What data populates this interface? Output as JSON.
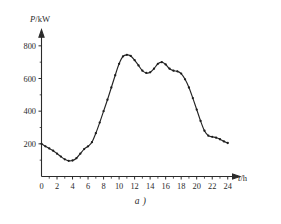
{
  "figure": {
    "caption": "a )"
  },
  "chart_data": {
    "type": "line",
    "title": "",
    "subtitle": "",
    "xlabel": "t/h",
    "ylabel": "P/kW",
    "xlabel_symbol": "t",
    "xlabel_unit": "/h",
    "ylabel_symbol": "P",
    "ylabel_unit": "/kW",
    "xlim": [
      0,
      25.2
    ],
    "ylim": [
      0,
      880
    ],
    "xticks_major": [
      0,
      2,
      4,
      6,
      8,
      10,
      12,
      14,
      16,
      18,
      20,
      22,
      24
    ],
    "xticks_major_labels": [
      "0",
      "2",
      "4",
      "6",
      "8",
      "10",
      "12",
      "14",
      "16",
      "18",
      "20",
      "22",
      "24"
    ],
    "xticks_minor": [
      1,
      3,
      5,
      7,
      9,
      11,
      13,
      15,
      17,
      19,
      21,
      23
    ],
    "yticks_major": [
      200,
      400,
      600,
      800
    ],
    "yticks_major_labels": [
      "200",
      "400",
      "600",
      "800"
    ],
    "yticks_minor": [
      100,
      300,
      500,
      700
    ],
    "grid": false,
    "legend": null,
    "marker": "dot",
    "line_color": "#242424",
    "marker_color": "#1d1d1d",
    "axis_color": "#2b2b2b",
    "x": [
      0.0,
      0.5,
      1.0,
      1.5,
      2.0,
      2.5,
      3.0,
      3.5,
      4.0,
      4.5,
      5.0,
      5.5,
      6.0,
      6.5,
      7.0,
      7.5,
      8.0,
      8.5,
      9.0,
      9.5,
      10.0,
      10.5,
      11.0,
      11.5,
      12.0,
      12.5,
      13.0,
      13.5,
      14.0,
      14.5,
      15.0,
      15.5,
      16.0,
      16.5,
      17.0,
      17.5,
      18.0,
      18.5,
      19.0,
      19.5,
      20.0,
      20.5,
      21.0,
      21.5,
      22.0,
      22.5,
      23.0,
      23.5,
      24.0
    ],
    "y": [
      200,
      185,
      172,
      158,
      140,
      122,
      105,
      96,
      98,
      112,
      140,
      168,
      185,
      210,
      265,
      330,
      400,
      470,
      545,
      620,
      690,
      735,
      745,
      738,
      712,
      680,
      648,
      634,
      638,
      660,
      690,
      700,
      686,
      660,
      648,
      644,
      630,
      595,
      545,
      480,
      410,
      340,
      280,
      250,
      243,
      238,
      228,
      215,
      205,
      198,
      195
    ]
  }
}
